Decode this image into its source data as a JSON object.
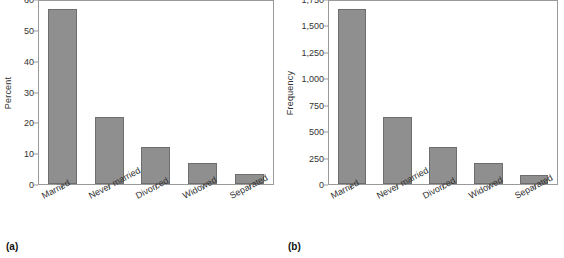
{
  "figure": {
    "bar_color": "#8f8f8f",
    "bar_edge_color": "#6e6e6e",
    "axis_color": "#9a9a9a"
  },
  "panels": [
    {
      "caption": "(a)",
      "chart_data": {
        "type": "bar",
        "title": "",
        "xlabel": "",
        "ylabel": "Percent",
        "categories": [
          "Married",
          "Never married",
          "Divorced",
          "Widowed",
          "Separated"
        ],
        "values": [
          56.7,
          21.8,
          12.0,
          6.8,
          3.2
        ],
        "ylim": [
          0,
          60
        ],
        "yticks": [
          0,
          10,
          20,
          30,
          40,
          50,
          60
        ],
        "ytick_labels": [
          "0",
          "10",
          "20",
          "30",
          "40",
          "50",
          "60"
        ],
        "grid": false,
        "legend": null
      }
    },
    {
      "caption": "(b)",
      "chart_data": {
        "type": "bar",
        "title": "",
        "xlabel": "",
        "ylabel": "Frequency",
        "categories": [
          "Married",
          "Never married",
          "Divorced",
          "Widowed",
          "Separated"
        ],
        "values": [
          1655,
          635,
          350,
          200,
          90
        ],
        "ylim": [
          0,
          1750
        ],
        "yticks": [
          0,
          250,
          500,
          750,
          1000,
          1250,
          1500,
          1750
        ],
        "ytick_labels": [
          "0",
          "250",
          "500",
          "750",
          "1,000",
          "1,250",
          "1,500",
          "1,750"
        ],
        "grid": false,
        "legend": null
      }
    }
  ]
}
